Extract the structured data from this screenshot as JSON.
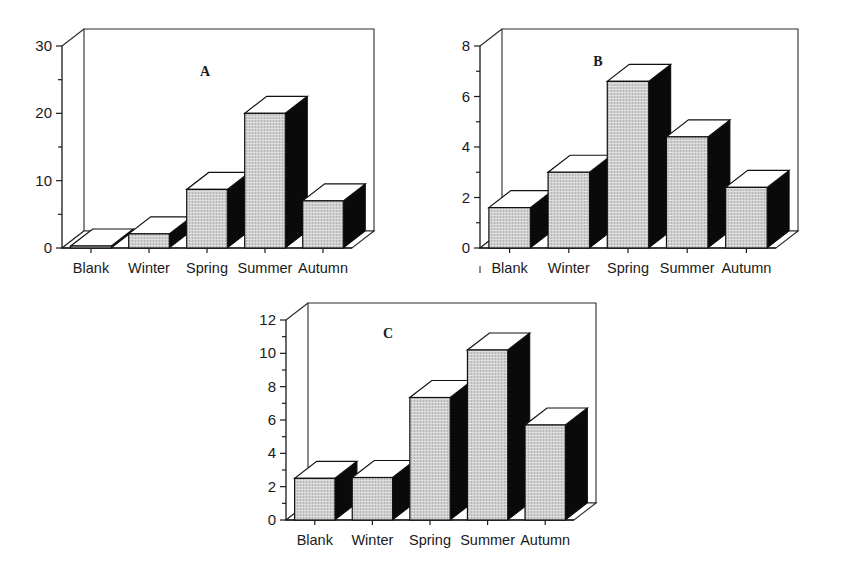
{
  "figure": {
    "title": "",
    "panel_count": 3
  },
  "chart_data": [
    {
      "type": "bar",
      "panel": "A",
      "title": "A",
      "categories": [
        "Blank",
        "Winter",
        "Spring",
        "Summer",
        "Autumn"
      ],
      "values": [
        0.3,
        2.1,
        8.7,
        20.0,
        7.0
      ],
      "xlabel": "",
      "ylabel": "",
      "ylim": [
        0,
        30
      ],
      "yticks": [
        0,
        10,
        20,
        30
      ],
      "yticklabels": [
        "0",
        "10",
        "20",
        "30"
      ],
      "yminorticks": [
        5,
        15,
        25
      ],
      "grid": false,
      "legend": false,
      "style": "3d-column"
    },
    {
      "type": "bar",
      "panel": "B",
      "title": "B",
      "categories": [
        "Blank",
        "Winter",
        "Spring",
        "Summer",
        "Autumn"
      ],
      "values": [
        1.6,
        3.0,
        6.6,
        4.4,
        2.4
      ],
      "xlabel": "",
      "ylabel": "",
      "ylim": [
        0,
        8
      ],
      "yticks": [
        0,
        2,
        4,
        6,
        8
      ],
      "yticklabels": [
        "0",
        "2",
        "4",
        "6",
        "8"
      ],
      "yminorticks": [
        1,
        3,
        5,
        7
      ],
      "grid": false,
      "legend": false,
      "style": "3d-column"
    },
    {
      "type": "bar",
      "panel": "C",
      "title": "C",
      "categories": [
        "Blank",
        "Winter",
        "Spring",
        "Summer",
        "Autumn"
      ],
      "values": [
        2.5,
        2.55,
        7.35,
        10.2,
        5.7
      ],
      "xlabel": "",
      "ylabel": "",
      "ylim": [
        0,
        12
      ],
      "yticks": [
        0,
        2,
        4,
        6,
        8,
        10,
        12
      ],
      "yticklabels": [
        "0",
        "2",
        "4",
        "6",
        "8",
        "10",
        "12"
      ],
      "yminorticks": [
        1,
        3,
        5,
        7,
        9,
        11
      ],
      "grid": false,
      "legend": false,
      "style": "3d-column"
    }
  ],
  "colors": {
    "bar_front": "#c9c9c9",
    "bar_side": "#0a0a0a",
    "bar_top": "#ffffff",
    "axis": "#1b1b1b",
    "text": "#1a1a1a",
    "background": "#ffffff"
  }
}
